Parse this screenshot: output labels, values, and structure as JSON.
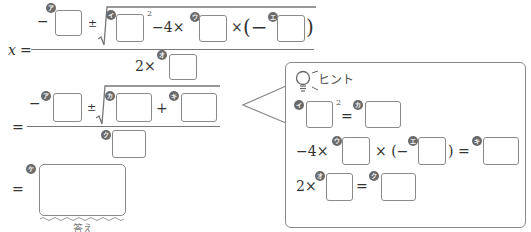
{
  "formula": {
    "lhs": "x",
    "equals": "=",
    "minus": "−",
    "plus_minus": "±",
    "minus_four_times": "−4×",
    "times": "×",
    "open_paren_minus": "(−",
    "close_paren": ")",
    "two_times": "2×",
    "plus": "+",
    "squared": "2"
  },
  "badges": {
    "a": "ア",
    "i": "イ",
    "u": "ウ",
    "e": "エ",
    "o": "オ",
    "ka": "カ",
    "ki": "キ",
    "ku": "ク",
    "ke": "ケ"
  },
  "answer": {
    "label": "答え"
  },
  "hint": {
    "title": "ヒント",
    "icon": "lightbulb-icon",
    "row1": {
      "equals": "=",
      "squared": "2"
    },
    "row2": {
      "prefix": "−4×",
      "times_paren": "× (−",
      "close_equals": ") ="
    },
    "row3": {
      "prefix": "2×",
      "equals": "="
    }
  },
  "colors": {
    "box_border": "#8a8a8a",
    "badge": "#6a6a6a",
    "text": "#333333"
  }
}
